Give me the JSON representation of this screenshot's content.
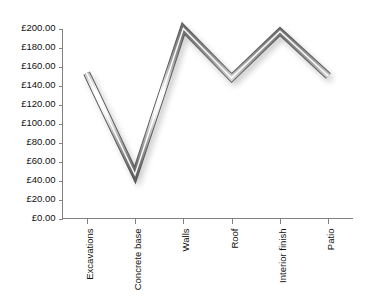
{
  "chart_data": {
    "type": "line",
    "title": "",
    "subtitle": "",
    "xlabel": "",
    "ylabel": "",
    "categories": [
      "Excavations",
      "Concrete base",
      "Walls",
      "Roof",
      "Interior finish",
      "Patio"
    ],
    "values": [
      153.0,
      46.0,
      200.0,
      148.0,
      197.0,
      150.0
    ],
    "series": [
      {
        "name": "Cost",
        "values": [
          153.0,
          46.0,
          200.0,
          148.0,
          197.0,
          150.0
        ]
      }
    ],
    "ylim": [
      0,
      200
    ],
    "ytick_step": 20,
    "ytick_labels": [
      "£200.00",
      "£180.00",
      "£160.00",
      "£140.00",
      "£120.00",
      "£100.00",
      "£80.00",
      "£60.00",
      "£40.00",
      "£20.00",
      "£0.00"
    ],
    "ytick_values": [
      200,
      180,
      160,
      140,
      120,
      100,
      80,
      60,
      40,
      20,
      0
    ],
    "currency_symbol": "£",
    "grid": false,
    "legend": false,
    "legend_position": "none",
    "annotations": [],
    "style": {
      "line_style": "3d-beveled-metallic",
      "line_color_dark": "#6e6e6e",
      "line_color_highlight": "#ffffff",
      "line_color_mid": "#b4b4b4",
      "shadow_color": "#9a9a9a",
      "axis_color": "#808080",
      "text_color": "#101010",
      "background_color": "#ffffff"
    }
  }
}
